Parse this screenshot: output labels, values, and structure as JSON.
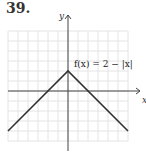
{
  "problem_number": "39.",
  "chart_data": {
    "type": "line",
    "title": "",
    "xlabel": "x",
    "ylabel": "y",
    "xlim": [
      -6,
      6
    ],
    "ylim": [
      -5,
      6
    ],
    "grid": true,
    "annotation": "f(x) = 2 − |x|",
    "series": [
      {
        "name": "f(x) = 2 − |x|",
        "points": [
          [
            -6,
            -4
          ],
          [
            0,
            2
          ],
          [
            6,
            -4
          ]
        ]
      }
    ]
  }
}
